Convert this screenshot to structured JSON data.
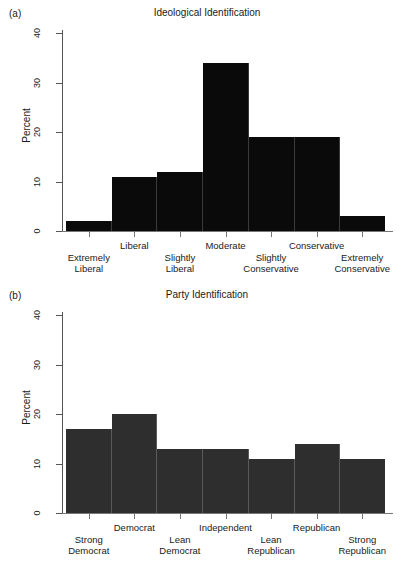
{
  "figure": {
    "background": "#ffffff",
    "text_color": "#1a1a1a"
  },
  "panels": [
    {
      "letter": "(a)",
      "title": "Ideological Identification",
      "ylabel": "Percent",
      "bar_color": "#0a0a0a"
    },
    {
      "letter": "(b)",
      "title": "Party Identification",
      "ylabel": "Percent",
      "bar_color": "#2e2e2e"
    }
  ],
  "yticks": [
    "0",
    "10",
    "20",
    "30",
    "40"
  ],
  "chart_data": [
    {
      "type": "bar",
      "title": "Ideological Identification",
      "panel": "(a)",
      "xlabel": "",
      "ylabel": "Percent",
      "ylim": [
        0,
        40
      ],
      "ytick_values": [
        0,
        10,
        20,
        30,
        40
      ],
      "grid": false,
      "legend": "none",
      "bar_color": "#0a0a0a",
      "categories": [
        "Extremely Liberal",
        "Liberal",
        "Slightly Liberal",
        "Moderate",
        "Slightly Conservative",
        "Conservative",
        "Extremely Conservative"
      ],
      "category_lines": [
        [
          "Extremely",
          "Liberal"
        ],
        [
          "Liberal",
          ""
        ],
        [
          "Slightly",
          "Liberal"
        ],
        [
          "Moderate",
          ""
        ],
        [
          "Slightly",
          "Conservative"
        ],
        [
          "Conservative",
          ""
        ],
        [
          "Extremely",
          "Conservative"
        ]
      ],
      "values": [
        2,
        11,
        12,
        34,
        19,
        19,
        3
      ]
    },
    {
      "type": "bar",
      "title": "Party Identification",
      "panel": "(b)",
      "xlabel": "",
      "ylabel": "Percent",
      "ylim": [
        0,
        40
      ],
      "ytick_values": [
        0,
        10,
        20,
        30,
        40
      ],
      "grid": false,
      "legend": "none",
      "bar_color": "#2e2e2e",
      "categories": [
        "Strong Democrat",
        "Democrat",
        "Lean Democrat",
        "Independent",
        "Lean Republican",
        "Republican",
        "Strong Republican"
      ],
      "category_lines": [
        [
          "Strong",
          "Democrat"
        ],
        [
          "Democrat",
          ""
        ],
        [
          "Lean",
          "Democrat"
        ],
        [
          "Independent",
          ""
        ],
        [
          "Lean",
          "Republican"
        ],
        [
          "Republican",
          ""
        ],
        [
          "Strong",
          "Republican"
        ]
      ],
      "values": [
        17,
        20,
        13,
        13,
        11,
        14,
        11
      ]
    }
  ]
}
